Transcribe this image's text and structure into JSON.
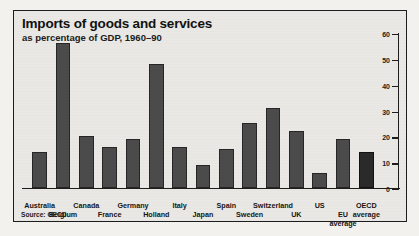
{
  "chart_data": {
    "type": "bar",
    "title": "Imports of goods and services",
    "subtitle": "as percentage of GDP, 1960–90",
    "source": "Source: OECD",
    "xlabel": "",
    "ylabel": "",
    "ylim": [
      0,
      60
    ],
    "yticks": [
      0,
      10,
      20,
      30,
      40,
      50,
      60
    ],
    "ytick_labels": [
      "0",
      "10",
      "20",
      "30",
      "40",
      "50",
      "60"
    ],
    "axis_position": "right",
    "grid": false,
    "legend": "none",
    "bar_color": "#4b4b4b",
    "highlight_color": "#2a2a2a",
    "categories": [
      "Australia",
      "Belgium",
      "Canada",
      "France",
      "Germany",
      "Holland",
      "Italy",
      "Japan",
      "Spain",
      "Sweden",
      "Switzerland",
      "UK",
      "US",
      "EU average",
      "OECD average"
    ],
    "values": [
      14,
      56,
      20,
      16,
      19,
      48,
      16,
      9,
      15,
      25,
      31,
      22,
      6,
      19,
      14
    ],
    "label_rows": [
      {
        "text": "Australia",
        "index": 0,
        "row": 0
      },
      {
        "text": "Belgium",
        "index": 1,
        "row": 1
      },
      {
        "text": "Canada",
        "index": 2,
        "row": 0
      },
      {
        "text": "France",
        "index": 3,
        "row": 1
      },
      {
        "text": "Germany",
        "index": 4,
        "row": 0
      },
      {
        "text": "Holland",
        "index": 5,
        "row": 1
      },
      {
        "text": "Italy",
        "index": 6,
        "row": 0
      },
      {
        "text": "Japan",
        "index": 7,
        "row": 1
      },
      {
        "text": "Spain",
        "index": 8,
        "row": 0
      },
      {
        "text": "Sweden",
        "index": 9,
        "row": 1
      },
      {
        "text": "Switzerland",
        "index": 10,
        "row": 0
      },
      {
        "text": "UK",
        "index": 11,
        "row": 1
      },
      {
        "text": "US",
        "index": 12,
        "row": 0
      },
      {
        "text": "EU\naverage",
        "index": 13,
        "row": 1
      },
      {
        "text": "OECD\naverage",
        "index": 14,
        "row": 0
      }
    ]
  }
}
